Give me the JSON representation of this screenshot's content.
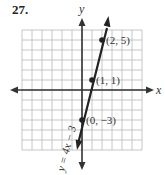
{
  "problem": {
    "number": "27."
  },
  "graph": {
    "x_axis_label": "x",
    "y_axis_label": "y",
    "grid": {
      "x_min": -6,
      "x_max": 6,
      "y_min": -6,
      "y_max": 6,
      "step": 1
    },
    "line": {
      "equation": "y = 4x − 3",
      "slope": 4,
      "intercept": -3
    },
    "points": [
      {
        "x": 2,
        "y": 5,
        "label": "(2, 5)"
      },
      {
        "x": 1,
        "y": 1,
        "label": "(1, 1)"
      },
      {
        "x": 0,
        "y": -3,
        "label": "(0, −3)"
      }
    ],
    "colors": {
      "grid": "#b8b8b8",
      "axis": "#333333",
      "line": "#222222",
      "text": "#333333"
    }
  }
}
